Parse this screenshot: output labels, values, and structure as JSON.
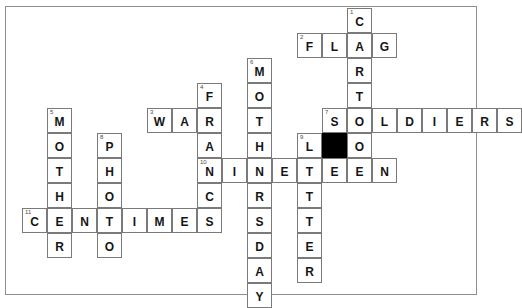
{
  "puzzle": {
    "title": "crossword-grid",
    "cell_size": 25,
    "origin": {
      "x": 22,
      "y": 8
    },
    "colors": {
      "cell_fill": "#ffffff",
      "cell_border": "#7a7a7a",
      "block_fill": "#000000",
      "letter": "#151515",
      "number": "#4a4a4a",
      "frame_border": "#8e8e8e",
      "page_background": "#ffffff"
    },
    "entries": [
      {
        "number": "1",
        "answer": "CARTOON",
        "direction": "down",
        "col": 13,
        "row": 0
      },
      {
        "number": "2",
        "answer": "FLAG",
        "direction": "across",
        "col": 11,
        "row": 1
      },
      {
        "number": "3",
        "answer": "WAR",
        "direction": "across",
        "col": 5,
        "row": 4
      },
      {
        "number": "4",
        "answer": "FRANC",
        "direction": "down",
        "col": 7,
        "row": 3
      },
      {
        "number": "5",
        "answer": "MOTHER",
        "direction": "down",
        "col": 1,
        "row": 4
      },
      {
        "number": "6",
        "answer": "MOTHERSDAY",
        "direction": "down",
        "col": 9,
        "row": 2
      },
      {
        "number": "7",
        "answer": "SOLDIERS",
        "direction": "across",
        "col": 12,
        "row": 4
      },
      {
        "number": "8",
        "answer": "PHOTO",
        "direction": "down",
        "col": 3,
        "row": 5
      },
      {
        "number": "9",
        "answer": "LETTER",
        "direction": "down",
        "col": 11,
        "row": 5
      },
      {
        "number": "10",
        "answer": "NINETEEN",
        "direction": "across",
        "col": 7,
        "row": 6
      },
      {
        "number": "11",
        "answer": "CENTIMES",
        "direction": "across",
        "col": 0,
        "row": 8
      }
    ],
    "cells": [
      {
        "col": 13,
        "row": 0,
        "letter": "C",
        "number": "1"
      },
      {
        "col": 11,
        "row": 1,
        "letter": "F",
        "number": "2"
      },
      {
        "col": 12,
        "row": 1,
        "letter": "L",
        "number": ""
      },
      {
        "col": 13,
        "row": 1,
        "letter": "A",
        "number": ""
      },
      {
        "col": 14,
        "row": 1,
        "letter": "G",
        "number": ""
      },
      {
        "col": 9,
        "row": 2,
        "letter": "M",
        "number": "6"
      },
      {
        "col": 13,
        "row": 2,
        "letter": "R",
        "number": ""
      },
      {
        "col": 7,
        "row": 3,
        "letter": "F",
        "number": "4"
      },
      {
        "col": 9,
        "row": 3,
        "letter": "O",
        "number": ""
      },
      {
        "col": 13,
        "row": 3,
        "letter": "T",
        "number": ""
      },
      {
        "col": 1,
        "row": 4,
        "letter": "M",
        "number": "5"
      },
      {
        "col": 5,
        "row": 4,
        "letter": "W",
        "number": "3"
      },
      {
        "col": 6,
        "row": 4,
        "letter": "A",
        "number": ""
      },
      {
        "col": 7,
        "row": 4,
        "letter": "R",
        "number": ""
      },
      {
        "col": 9,
        "row": 4,
        "letter": "T",
        "number": ""
      },
      {
        "col": 12,
        "row": 4,
        "letter": "S",
        "number": "7"
      },
      {
        "col": 13,
        "row": 4,
        "letter": "O",
        "number": ""
      },
      {
        "col": 14,
        "row": 4,
        "letter": "L",
        "number": ""
      },
      {
        "col": 15,
        "row": 4,
        "letter": "D",
        "number": ""
      },
      {
        "col": 16,
        "row": 4,
        "letter": "I",
        "number": ""
      },
      {
        "col": 17,
        "row": 4,
        "letter": "E",
        "number": ""
      },
      {
        "col": 18,
        "row": 4,
        "letter": "R",
        "number": ""
      },
      {
        "col": 19,
        "row": 4,
        "letter": "S",
        "number": ""
      },
      {
        "col": 1,
        "row": 5,
        "letter": "O",
        "number": ""
      },
      {
        "col": 3,
        "row": 5,
        "letter": "P",
        "number": "8"
      },
      {
        "col": 7,
        "row": 5,
        "letter": "A",
        "number": ""
      },
      {
        "col": 9,
        "row": 5,
        "letter": "H",
        "number": ""
      },
      {
        "col": 11,
        "row": 5,
        "letter": "L",
        "number": "9"
      },
      {
        "col": 12,
        "row": 5,
        "letter": "",
        "number": "",
        "block": true
      },
      {
        "col": 13,
        "row": 5,
        "letter": "O",
        "number": ""
      },
      {
        "col": 1,
        "row": 6,
        "letter": "T",
        "number": ""
      },
      {
        "col": 3,
        "row": 6,
        "letter": "H",
        "number": ""
      },
      {
        "col": 7,
        "row": 6,
        "letter": "N",
        "number": "10"
      },
      {
        "col": 8,
        "row": 6,
        "letter": "I",
        "number": ""
      },
      {
        "col": 9,
        "row": 6,
        "letter": "N",
        "number": ""
      },
      {
        "col": 10,
        "row": 6,
        "letter": "E",
        "number": ""
      },
      {
        "col": 11,
        "row": 6,
        "letter": "T",
        "number": ""
      },
      {
        "col": 12,
        "row": 6,
        "letter": "E",
        "number": ""
      },
      {
        "col": 13,
        "row": 6,
        "letter": "E",
        "number": ""
      },
      {
        "col": 14,
        "row": 6,
        "letter": "N",
        "number": ""
      },
      {
        "col": 1,
        "row": 7,
        "letter": "H",
        "number": ""
      },
      {
        "col": 3,
        "row": 7,
        "letter": "O",
        "number": ""
      },
      {
        "col": 7,
        "row": 7,
        "letter": "C",
        "number": ""
      },
      {
        "col": 9,
        "row": 7,
        "letter": "R",
        "number": ""
      },
      {
        "col": 11,
        "row": 7,
        "letter": "T",
        "number": ""
      },
      {
        "col": 0,
        "row": 8,
        "letter": "C",
        "number": "11"
      },
      {
        "col": 1,
        "row": 8,
        "letter": "E",
        "number": ""
      },
      {
        "col": 2,
        "row": 8,
        "letter": "N",
        "number": ""
      },
      {
        "col": 3,
        "row": 8,
        "letter": "T",
        "number": ""
      },
      {
        "col": 4,
        "row": 8,
        "letter": "I",
        "number": ""
      },
      {
        "col": 5,
        "row": 8,
        "letter": "M",
        "number": ""
      },
      {
        "col": 6,
        "row": 8,
        "letter": "E",
        "number": ""
      },
      {
        "col": 7,
        "row": 8,
        "letter": "S",
        "number": ""
      },
      {
        "col": 9,
        "row": 8,
        "letter": "S",
        "number": ""
      },
      {
        "col": 11,
        "row": 8,
        "letter": "T",
        "number": ""
      },
      {
        "col": 1,
        "row": 9,
        "letter": "R",
        "number": ""
      },
      {
        "col": 3,
        "row": 9,
        "letter": "O",
        "number": ""
      },
      {
        "col": 9,
        "row": 9,
        "letter": "D",
        "number": ""
      },
      {
        "col": 11,
        "row": 9,
        "letter": "E",
        "number": ""
      },
      {
        "col": 9,
        "row": 10,
        "letter": "A",
        "number": ""
      },
      {
        "col": 11,
        "row": 10,
        "letter": "R",
        "number": ""
      },
      {
        "col": 9,
        "row": 11,
        "letter": "Y",
        "number": ""
      }
    ]
  }
}
